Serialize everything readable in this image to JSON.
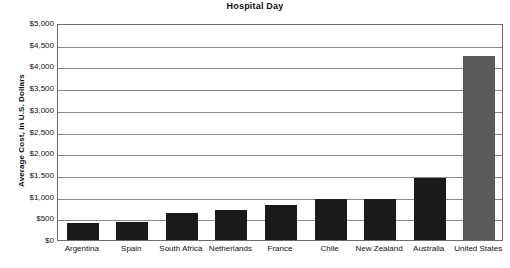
{
  "chart_data": {
    "type": "bar",
    "title": "Hospital Day",
    "xlabel": "",
    "ylabel": "Average Cost, in U.S. Dollars",
    "ylim": [
      0,
      5000
    ],
    "ytick_labels": [
      "$5,000",
      "$4,500",
      "$4,000",
      "$3,500",
      "$3,000",
      "$2,500",
      "$2,000",
      "$1,500",
      "$1,000",
      "$500",
      "$0"
    ],
    "ytick_values": [
      5000,
      4500,
      4000,
      3500,
      3000,
      2500,
      2000,
      1500,
      1000,
      500,
      0
    ],
    "grid": true,
    "legend": "none",
    "categories": [
      "Argentina",
      "Spain",
      "South Africa",
      "Netherlands",
      "France",
      "Chile",
      "New Zealand",
      "Australia",
      "United States"
    ],
    "values": [
      400,
      410,
      620,
      700,
      800,
      950,
      940,
      1430,
      4250
    ],
    "bar_colors": [
      "#1a1a1a",
      "#1a1a1a",
      "#1a1a1a",
      "#1a1a1a",
      "#1a1a1a",
      "#1a1a1a",
      "#1a1a1a",
      "#1a1a1a",
      "#5a5a5a"
    ],
    "highlight_category": "United States",
    "highlight_color": "#5a5a5a",
    "default_bar_color": "#1a1a1a",
    "axis_color": "#6b6b6b",
    "gridline_color": "#8a8a8a"
  }
}
